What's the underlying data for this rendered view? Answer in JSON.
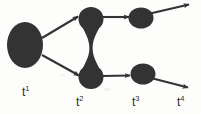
{
  "figure": {
    "kind": "cell-lineage-tracking-diagram",
    "background_color": "#fdfdfc",
    "ink_color": "#333333",
    "label_color": "#2b2b2b",
    "width": 201,
    "height": 114
  },
  "timepoints": [
    {
      "id": "t1",
      "label": "t",
      "exponent": "1",
      "x": 22,
      "y": 94
    },
    {
      "id": "t2",
      "label": "t",
      "exponent": "2",
      "x": 76,
      "y": 104
    },
    {
      "id": "t3",
      "label": "t",
      "exponent": "3",
      "x": 132,
      "y": 104
    },
    {
      "id": "t4",
      "label": "t",
      "exponent": "4",
      "x": 177,
      "y": 104
    }
  ],
  "nodes": [
    {
      "id": "node-t1",
      "timepoint": "t1",
      "branch": "root",
      "cx": 25,
      "cy": 45,
      "rx": 18,
      "ry": 23
    },
    {
      "id": "node-t2-upper",
      "timepoint": "t2",
      "branch": "upper",
      "cx": 91,
      "cy": 19,
      "rx": 12,
      "ry": 12
    },
    {
      "id": "node-t2-lower",
      "timepoint": "t2",
      "branch": "lower",
      "cx": 91,
      "cy": 77,
      "rx": 12,
      "ry": 12
    },
    {
      "id": "node-t3-upper",
      "timepoint": "t3",
      "branch": "upper",
      "cx": 141,
      "cy": 18,
      "rx": 12,
      "ry": 10
    },
    {
      "id": "node-t3-lower",
      "timepoint": "t3",
      "branch": "lower",
      "cx": 143,
      "cy": 74,
      "rx": 12,
      "ry": 10
    }
  ],
  "connector": {
    "id": "t2-dividing-neck",
    "description": "pinched metaball neck joining the two t2 blobs",
    "from": "node-t2-upper",
    "to": "node-t2-lower",
    "waist_x": 91,
    "waist_y": 48,
    "waist_half_width": 1.6
  },
  "arrows": [
    {
      "id": "arrow-t1-to-t2-upper",
      "from": "node-t1",
      "to": "node-t2-upper",
      "x1": 42,
      "y1": 38,
      "x2": 79,
      "y2": 16
    },
    {
      "id": "arrow-t1-to-t2-lower",
      "from": "node-t1",
      "to": "node-t2-lower",
      "x1": 42,
      "y1": 55,
      "x2": 80,
      "y2": 76
    },
    {
      "id": "arrow-t2-upper-to-t3-upper",
      "from": "node-t2-upper",
      "to": "node-t3-upper",
      "x1": 103,
      "y1": 17,
      "x2": 130,
      "y2": 17
    },
    {
      "id": "arrow-t2-lower-to-t3-lower",
      "from": "node-t2-lower",
      "to": "node-t3-lower",
      "x1": 103,
      "y1": 76,
      "x2": 131,
      "y2": 75
    },
    {
      "id": "arrow-t3-upper-to-t4",
      "from": "node-t3-upper",
      "to": "t4",
      "x1": 149,
      "y1": 14,
      "x2": 191,
      "y2": 4
    },
    {
      "id": "arrow-t3-lower-to-t4",
      "from": "node-t3-lower",
      "to": "t4",
      "x1": 152,
      "y1": 78,
      "x2": 190,
      "y2": 88
    }
  ]
}
